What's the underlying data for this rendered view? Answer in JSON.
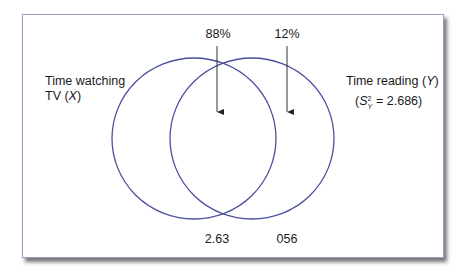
{
  "diagram": {
    "type": "venn",
    "circles": [
      {
        "id": "x",
        "label_line1": "Time watching",
        "label_line2_prefix": "TV (",
        "label_var": "X",
        "label_line2_suffix": ")"
      },
      {
        "id": "y",
        "label_line1_prefix": "Time reading (",
        "label_var": "Y",
        "label_line1_suffix": ")",
        "variance_open": "(",
        "variance_symbol": "S",
        "variance_sup": "2",
        "variance_sub": "Y",
        "variance_value": " = 2.686)"
      }
    ],
    "top_annotations": [
      {
        "label": "88%",
        "points_to": "overlap"
      },
      {
        "label": "12%",
        "points_to": "y-only"
      }
    ],
    "bottom_annotations": [
      {
        "label": "2.63",
        "region": "overlap"
      },
      {
        "label": "056",
        "region": "y-only"
      }
    ],
    "colors": {
      "circle_stroke": "#4a4fa0",
      "arrow": "#333333",
      "frame_border": "#9a9cc4",
      "text": "#1a1a1a"
    }
  }
}
